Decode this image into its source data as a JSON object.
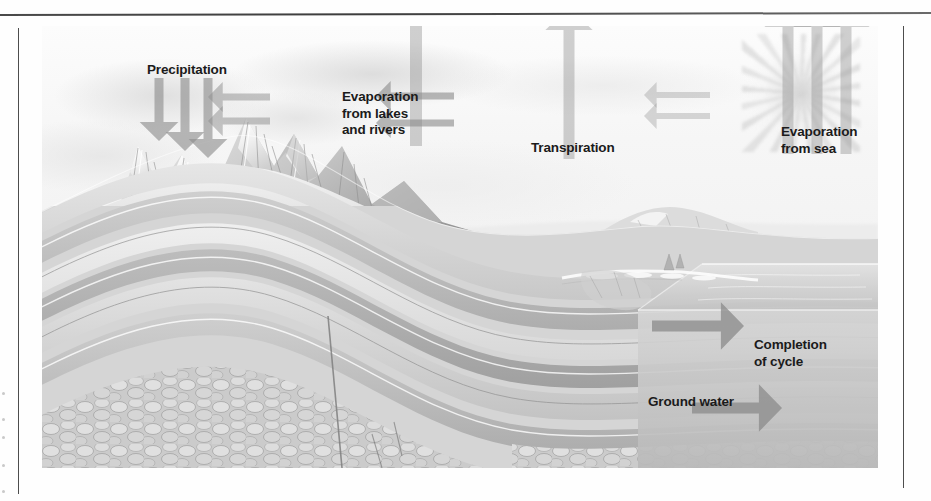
{
  "figure": {
    "type": "water-cycle-diagram",
    "medium": "grayscale scanned textbook illustration",
    "colors": {
      "label_text": "#1b1b1b",
      "arrow_fill": "#8d8d8d",
      "rule": "#4d4d4d",
      "page_background": "#ffffff",
      "sky": "#f6f6f6",
      "rock_light": "#d9d9d9",
      "rock_mid": "#bdbdbd",
      "rock_dark": "#9a9a9a",
      "sea_block": "#d2d2d2"
    }
  },
  "labels": [
    {
      "id": "precipitation",
      "text": "Precipitation",
      "x": 105,
      "y": 36,
      "align": "left"
    },
    {
      "id": "evaporation-lakes",
      "text": "Evaporation\nfrom lakes\nand rivers",
      "x": 300,
      "y": 63,
      "align": "left"
    },
    {
      "id": "transpiration",
      "text": "Transpiration",
      "x": 489,
      "y": 114,
      "align": "left"
    },
    {
      "id": "evaporation-sea",
      "text": "Evaporation\nfrom sea",
      "x": 739,
      "y": 98,
      "align": "left"
    },
    {
      "id": "completion",
      "text": "Completion\nof cycle",
      "x": 712,
      "y": 311,
      "align": "left"
    },
    {
      "id": "ground-water",
      "text": "Ground water",
      "x": 606,
      "y": 368,
      "align": "left"
    }
  ],
  "arrows": [
    {
      "id": "precipitation-arrow-1",
      "direction": "down",
      "x": 117,
      "y": 52,
      "length": 63,
      "width": 9,
      "opacity": 0.62
    },
    {
      "id": "precipitation-arrow-2",
      "direction": "down",
      "x": 143,
      "y": 52,
      "length": 73,
      "width": 9,
      "opacity": 0.62
    },
    {
      "id": "precipitation-arrow-3",
      "direction": "down",
      "x": 166,
      "y": 52,
      "length": 80,
      "width": 9,
      "opacity": 0.62
    },
    {
      "id": "wind-arrow-left-1",
      "direction": "left",
      "x": 228,
      "y": 71,
      "length": 62,
      "width": 7,
      "opacity": 0.5
    },
    {
      "id": "wind-arrow-left-2",
      "direction": "left",
      "x": 228,
      "y": 95,
      "length": 62,
      "width": 7,
      "opacity": 0.5
    },
    {
      "id": "wind-arrow-mid-1",
      "direction": "left",
      "x": 412,
      "y": 70,
      "length": 78,
      "width": 7,
      "opacity": 0.62
    },
    {
      "id": "wind-arrow-mid-2",
      "direction": "left",
      "x": 412,
      "y": 97,
      "length": 78,
      "width": 7,
      "opacity": 0.62
    },
    {
      "id": "wind-arrow-right-1",
      "direction": "left",
      "x": 668,
      "y": 69,
      "length": 66,
      "width": 6,
      "opacity": 0.33
    },
    {
      "id": "wind-arrow-right-2",
      "direction": "left",
      "x": 668,
      "y": 90,
      "length": 66,
      "width": 6,
      "opacity": 0.33
    },
    {
      "id": "evaporation-lake-arrow",
      "direction": "up",
      "x": 374,
      "y": 120,
      "length": 168,
      "width": 12,
      "opacity": 0.4
    },
    {
      "id": "transpiration-arrow",
      "direction": "up",
      "x": 527,
      "y": 133,
      "length": 152,
      "width": 11,
      "opacity": 0.4
    },
    {
      "id": "evaporation-sea-arrow-1",
      "direction": "up",
      "x": 746,
      "y": 128,
      "length": 150,
      "width": 11,
      "opacity": 0.4
    },
    {
      "id": "evaporation-sea-arrow-2",
      "direction": "up",
      "x": 775,
      "y": 128,
      "length": 150,
      "width": 11,
      "opacity": 0.4
    },
    {
      "id": "evaporation-sea-arrow-3",
      "direction": "up",
      "x": 804,
      "y": 128,
      "length": 150,
      "width": 11,
      "opacity": 0.4
    },
    {
      "id": "groundwater-flow-arrow-1",
      "direction": "right",
      "x": 610,
      "y": 300,
      "length": 92,
      "width": 11,
      "opacity": 0.78
    },
    {
      "id": "groundwater-flow-arrow-2",
      "direction": "right",
      "x": 650,
      "y": 382,
      "length": 90,
      "width": 11,
      "opacity": 0.78
    }
  ],
  "scene_elements": [
    {
      "id": "mountain-range",
      "description": "snow-capped folded mountain peaks at left"
    },
    {
      "id": "clouds",
      "description": "diffuse cloud band across upper sky"
    },
    {
      "id": "sun",
      "description": "radiating sun in upper right sky"
    },
    {
      "id": "conifer-forest",
      "description": "stand of conifer trees in the middle valley"
    },
    {
      "id": "lake",
      "description": "inland lake in the valley floor"
    },
    {
      "id": "river",
      "description": "river winding from mountains to lake"
    },
    {
      "id": "sea",
      "description": "ocean water body at right of cross-section"
    },
    {
      "id": "rock-strata",
      "description": "folded sedimentary rock layers in cut-away cross-section"
    },
    {
      "id": "cobble-bed",
      "description": "rounded cobble / conglomerate bed at base of section"
    },
    {
      "id": "fault-line",
      "description": "vertical fault offsetting strata at lower centre"
    }
  ]
}
